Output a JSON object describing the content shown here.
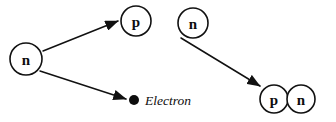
{
  "diagram": {
    "width": 336,
    "height": 122,
    "background_color": "#ffffff",
    "stroke_color": "#111111",
    "text_color": "#0d0d0d"
  },
  "particles": [
    {
      "id": "neutron-source",
      "label": "n",
      "name": "neutron",
      "cx": 26,
      "cy": 59,
      "r": 16
    },
    {
      "id": "proton-product",
      "label": "p",
      "name": "proton",
      "cx": 136,
      "cy": 21,
      "r": 15
    },
    {
      "id": "neutron-free",
      "label": "n",
      "name": "neutron",
      "cx": 193,
      "cy": 23,
      "r": 15
    },
    {
      "id": "proton-bound",
      "label": "p",
      "name": "proton",
      "cx": 274,
      "cy": 99,
      "r": 14
    },
    {
      "id": "neutron-bound",
      "label": "n",
      "name": "neutron",
      "cx": 301,
      "cy": 99,
      "r": 14
    }
  ],
  "arrows": [
    {
      "id": "arrow-neutron-to-proton",
      "name": "neutron-to-proton-arrow",
      "x1": 43,
      "y1": 51,
      "x2": 118,
      "y2": 21
    },
    {
      "id": "arrow-neutron-to-electron",
      "name": "neutron-to-electron-arrow",
      "x1": 40,
      "y1": 71,
      "x2": 126,
      "y2": 99
    },
    {
      "id": "arrow-neutron-to-pair",
      "name": "neutron-to-proton-neutron-pair-arrow",
      "x1": 181,
      "y1": 38,
      "x2": 260,
      "y2": 86
    }
  ],
  "electron": {
    "label": "Electron",
    "dot_cx": 134,
    "dot_cy": 100,
    "dot_r": 5,
    "text_x": 145,
    "text_y": 100
  }
}
